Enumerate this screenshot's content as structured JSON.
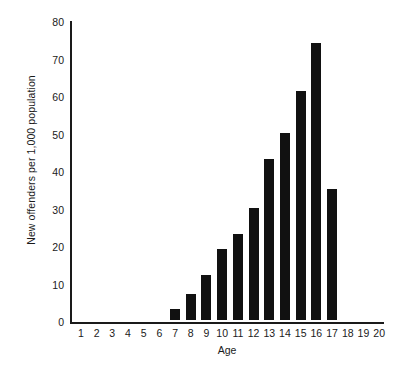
{
  "chart_data": {
    "type": "bar",
    "title": "",
    "xlabel": "Age",
    "ylabel": "New offenders per 1,000 population",
    "categories": [
      1,
      2,
      3,
      4,
      5,
      6,
      7,
      8,
      9,
      10,
      11,
      12,
      13,
      14,
      15,
      16,
      17,
      18,
      19,
      20
    ],
    "values": [
      0,
      0,
      0,
      0,
      0,
      0,
      3,
      7,
      12,
      19,
      23,
      30,
      43,
      50,
      61,
      74,
      35,
      0,
      0,
      0
    ],
    "xtick_labels": [
      "1",
      "2",
      "3",
      "4",
      "5",
      "6",
      "7",
      "8",
      "9",
      "10",
      "11",
      "12",
      "13",
      "14",
      "15",
      "16",
      "17",
      "18",
      "19",
      "20"
    ],
    "ytick_labels": [
      "0",
      "10",
      "20",
      "30",
      "40",
      "50",
      "60",
      "70",
      "80"
    ],
    "yticks": [
      0,
      10,
      20,
      30,
      40,
      50,
      60,
      70,
      80
    ],
    "ylim": [
      0,
      80
    ],
    "xlim": [
      0.5,
      20.5
    ],
    "grid": false,
    "legend": null,
    "bar_color": "#111111",
    "axis_color": "#1a1a1a",
    "background_color": "#ffffff"
  }
}
